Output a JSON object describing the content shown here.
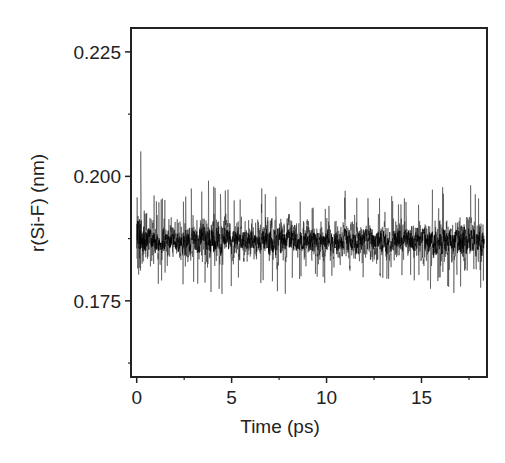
{
  "chart_data": {
    "type": "line",
    "title": "",
    "xlabel": "Time (ps)",
    "ylabel": "r(Si-F) (nm)",
    "xlim": [
      -0.3,
      18.45
    ],
    "ylim": [
      0.1597,
      0.2298
    ],
    "x_ticks": [
      0,
      5,
      10,
      15
    ],
    "x_tick_labels": [
      "0",
      "5",
      "10",
      "15"
    ],
    "x_minor_ticks": [
      2.5,
      7.5,
      12.5,
      17.5
    ],
    "y_ticks": [
      0.175,
      0.2,
      0.225
    ],
    "y_tick_labels": [
      "0.175",
      "0.200",
      "0.225"
    ],
    "y_minor_ticks": [
      0.1625,
      0.1875,
      0.2125
    ],
    "grid": false,
    "legend": null,
    "series": [
      {
        "name": "r(Si-F)",
        "color": "#1a1a1a",
        "description": "Noisy bond-length time series; initial spike near t=0 reaching ~0.228 nm and dipping to ~0.163 nm, then fluctuating around a mean of ~0.187 nm with peaks ~0.203 nm and troughs ~0.174 nm up to t≈18.3 ps",
        "t_start": 0,
        "t_end": 18.3,
        "mean": 0.187,
        "typical_max": 0.2035,
        "typical_min": 0.1735,
        "initial_max": 0.228,
        "initial_min": 0.163,
        "samples": [
          {
            "t": 0.0,
            "min": 0.163,
            "max": 0.228
          },
          {
            "t": 0.3,
            "min": 0.17,
            "max": 0.206
          },
          {
            "t": 1.0,
            "min": 0.176,
            "max": 0.199
          },
          {
            "t": 2.0,
            "min": 0.176,
            "max": 0.198
          },
          {
            "t": 3.0,
            "min": 0.176,
            "max": 0.201
          },
          {
            "t": 4.0,
            "min": 0.174,
            "max": 0.203
          },
          {
            "t": 5.0,
            "min": 0.176,
            "max": 0.199
          },
          {
            "t": 6.0,
            "min": 0.177,
            "max": 0.197
          },
          {
            "t": 7.0,
            "min": 0.175,
            "max": 0.201
          },
          {
            "t": 8.0,
            "min": 0.175,
            "max": 0.2
          },
          {
            "t": 9.0,
            "min": 0.177,
            "max": 0.197
          },
          {
            "t": 10.0,
            "min": 0.177,
            "max": 0.197
          },
          {
            "t": 11.0,
            "min": 0.176,
            "max": 0.199
          },
          {
            "t": 12.0,
            "min": 0.176,
            "max": 0.198
          },
          {
            "t": 13.0,
            "min": 0.176,
            "max": 0.199
          },
          {
            "t": 14.0,
            "min": 0.177,
            "max": 0.197
          },
          {
            "t": 15.0,
            "min": 0.176,
            "max": 0.199
          },
          {
            "t": 16.0,
            "min": 0.175,
            "max": 0.201
          },
          {
            "t": 17.0,
            "min": 0.174,
            "max": 0.201
          },
          {
            "t": 18.3,
            "min": 0.175,
            "max": 0.2
          }
        ]
      }
    ]
  },
  "layout": {
    "plot_left": 131,
    "plot_right": 487,
    "plot_top": 28,
    "plot_bottom": 377,
    "frame_color": "#222222",
    "background": "#ffffff"
  }
}
